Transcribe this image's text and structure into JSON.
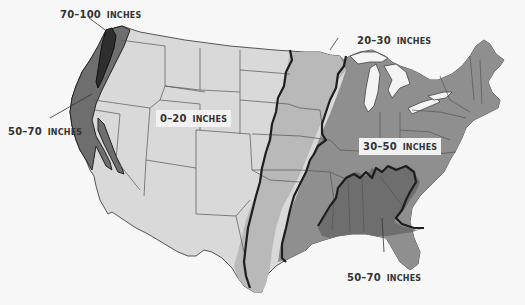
{
  "map": {
    "title": "Average Annual Precipitation, Contiguous United States",
    "colors": {
      "background": "#f7f7f7",
      "zone_0_20": "#d9d9d9",
      "zone_20_30": "#b9b9b9",
      "zone_30_50": "#8f8f8f",
      "zone_50_70": "#6e6e6e",
      "zone_70_100": "#2e2e2e",
      "state_border": "#444444",
      "zone_border": "#1e1e1e",
      "water": "#f4f4f4"
    },
    "labels": [
      {
        "id": "label-70-100",
        "range": "70–100",
        "unit": "INCHES"
      },
      {
        "id": "label-50-70-west",
        "range": "50–70",
        "unit": "INCHES"
      },
      {
        "id": "label-0-20",
        "range": "0–20",
        "unit": "INCHES"
      },
      {
        "id": "label-20-30",
        "range": "20–30",
        "unit": "INCHES"
      },
      {
        "id": "label-30-50",
        "range": "30–50",
        "unit": "INCHES"
      },
      {
        "id": "label-50-70-south",
        "range": "50–70",
        "unit": "INCHES"
      }
    ],
    "legend_zones": [
      {
        "range": "0–20 inches",
        "color": "#d9d9d9"
      },
      {
        "range": "20–30 inches",
        "color": "#b9b9b9"
      },
      {
        "range": "30–50 inches",
        "color": "#8f8f8f"
      },
      {
        "range": "50–70 inches",
        "color": "#6e6e6e"
      },
      {
        "range": "70–100 inches",
        "color": "#2e2e2e"
      }
    ]
  }
}
